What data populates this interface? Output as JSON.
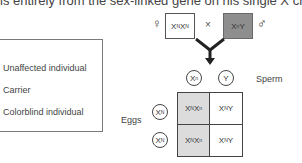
{
  "header": {
    "text": "is entirely from the sex-linked gene on his single X chromosome"
  },
  "legend": {
    "items": [
      {
        "label": "Unaffected individual"
      },
      {
        "label": "Carrier"
      },
      {
        "label": "Colorblind individual"
      }
    ]
  },
  "cross": {
    "female_symbol": "♀",
    "male_symbol": "♂",
    "cross_symbol": "×",
    "mother": {
      "base": "X",
      "sup1": "N",
      "base2": "X",
      "sup2": "N",
      "genotype": "XNXN",
      "fill": "#ffffff"
    },
    "father": {
      "base": "X",
      "sup1": "n",
      "base2": "Y",
      "genotype": "XnY",
      "fill": "#8e8e8e"
    }
  },
  "punnett": {
    "sperm_label": "Sperm",
    "eggs_label": "Eggs",
    "sperm": [
      {
        "base": "X",
        "sup": "n"
      },
      {
        "base": "Y",
        "sup": ""
      }
    ],
    "eggs": [
      {
        "base": "X",
        "sup": "N"
      },
      {
        "base": "X",
        "sup": "N"
      }
    ],
    "cells": [
      {
        "b1": "X",
        "s1": "N",
        "b2": "X",
        "s2": "n",
        "genotype": "XNXn",
        "status": "Carrier",
        "fill": "#dcdcdc"
      },
      {
        "b1": "X",
        "s1": "N",
        "b2": "Y",
        "s2": "",
        "genotype": "XNY",
        "status": "Unaffected individual",
        "fill": "#ffffff"
      },
      {
        "b1": "X",
        "s1": "N",
        "b2": "X",
        "s2": "n",
        "genotype": "XNXn",
        "status": "Carrier",
        "fill": "#dcdcdc"
      },
      {
        "b1": "X",
        "s1": "N",
        "b2": "Y",
        "s2": "",
        "genotype": "XNY",
        "status": "Unaffected individual",
        "fill": "#ffffff"
      }
    ]
  },
  "colors": {
    "unaffected": "#ffffff",
    "carrier": "#dcdcdc",
    "colorblind": "#8e8e8e"
  }
}
